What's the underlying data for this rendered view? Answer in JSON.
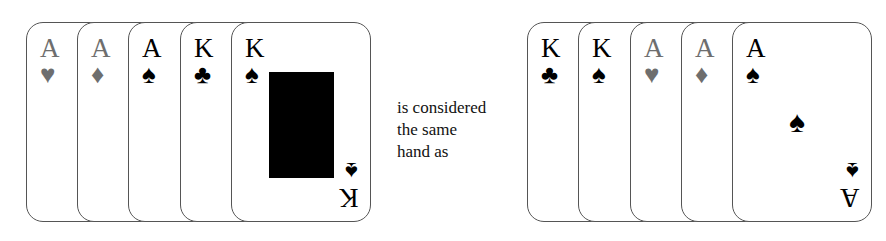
{
  "left_hand": {
    "cards": [
      {
        "rank": "A",
        "suit": "♥",
        "suit_name": "hearts",
        "color": "red",
        "x": 26
      },
      {
        "rank": "A",
        "suit": "♦",
        "suit_name": "diamonds",
        "color": "red",
        "x": 77
      },
      {
        "rank": "A",
        "suit": "♠",
        "suit_name": "spades",
        "color": "black",
        "x": 128
      },
      {
        "rank": "K",
        "suit": "♣",
        "suit_name": "clubs",
        "color": "black",
        "x": 180
      },
      {
        "rank": "K",
        "suit": "♠",
        "suit_name": "spades",
        "color": "black",
        "x": 231,
        "face": true
      }
    ]
  },
  "caption": {
    "line1": "is considered",
    "line2": "the same",
    "line3": "hand as"
  },
  "right_hand": {
    "cards": [
      {
        "rank": "K",
        "suit": "♣",
        "suit_name": "clubs",
        "color": "black",
        "x": 527
      },
      {
        "rank": "K",
        "suit": "♠",
        "suit_name": "spades",
        "color": "black",
        "x": 578
      },
      {
        "rank": "A",
        "suit": "♥",
        "suit_name": "hearts",
        "color": "red",
        "x": 630
      },
      {
        "rank": "A",
        "suit": "♦",
        "suit_name": "diamonds",
        "color": "red",
        "x": 681
      },
      {
        "rank": "A",
        "suit": "♠",
        "suit_name": "spades",
        "color": "black",
        "x": 732,
        "center": true
      }
    ]
  },
  "colors": {
    "red_suit": "#6e6e6e",
    "black_suit": "#000000",
    "card_border": "#555555"
  }
}
